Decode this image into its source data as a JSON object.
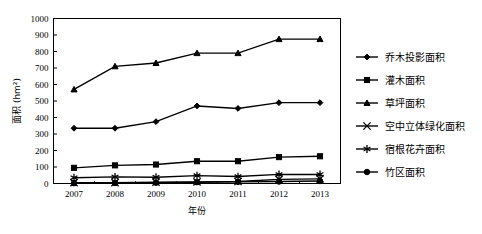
{
  "chart_data": {
    "type": "line",
    "title": "",
    "xlabel": "年份",
    "ylabel": "面积 (hm²)",
    "categories": [
      "2007",
      "2008",
      "2009",
      "2010",
      "2011",
      "2012",
      "2013"
    ],
    "x": [
      2007,
      2008,
      2009,
      2010,
      2011,
      2012,
      2013
    ],
    "ylim": [
      0,
      1000
    ],
    "ytick_step": 100,
    "yticks": [
      0,
      100,
      200,
      300,
      400,
      500,
      600,
      700,
      800,
      900,
      1000
    ],
    "ytick_labels": [
      "0",
      "100",
      "200",
      "300",
      "400",
      "500",
      "600",
      "700",
      "800",
      "900",
      "1000"
    ],
    "grid": false,
    "legend_position": "right",
    "series": [
      {
        "name": "乔木投影面积",
        "marker": "diamond",
        "values": [
          335,
          335,
          375,
          470,
          455,
          490,
          490
        ]
      },
      {
        "name": "灌木面积",
        "marker": "square",
        "values": [
          95,
          110,
          115,
          135,
          135,
          160,
          165
        ]
      },
      {
        "name": "草坪面积",
        "marker": "triangle",
        "values": [
          570,
          710,
          730,
          790,
          790,
          875,
          875
        ]
      },
      {
        "name": "空中立体绿化面积",
        "marker": "x-cross",
        "values": [
          5,
          5,
          8,
          10,
          12,
          25,
          28
        ]
      },
      {
        "name": "宿根花卉面积",
        "marker": "asterisk",
        "values": [
          35,
          40,
          38,
          48,
          42,
          55,
          55
        ]
      },
      {
        "name": "竹区面积",
        "marker": "circle",
        "values": [
          2,
          3,
          5,
          8,
          10,
          12,
          15
        ]
      }
    ]
  },
  "axes": {
    "y_axis_title": "面积 (hm²)",
    "x_axis_title": "年份"
  },
  "legend": {
    "items": [
      {
        "label": "乔木投影面积",
        "marker": "diamond"
      },
      {
        "label": "灌木面积",
        "marker": "square"
      },
      {
        "label": "草坪面积",
        "marker": "triangle"
      },
      {
        "label": "空中立体绿化面积",
        "marker": "x-cross"
      },
      {
        "label": "宿根花卉面积",
        "marker": "asterisk"
      },
      {
        "label": "竹区面积",
        "marker": "circle"
      }
    ]
  },
  "colors": {
    "ink": "#000000",
    "background": "#ffffff"
  }
}
